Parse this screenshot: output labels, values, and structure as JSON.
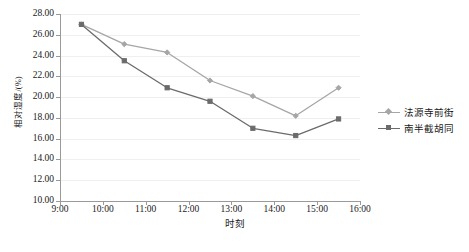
{
  "chart_data": {
    "type": "line",
    "title": "",
    "xlabel": "时刻",
    "ylabel": "相对湿度/(%)",
    "xlim": [
      "9:00",
      "16:00"
    ],
    "ylim": [
      10.0,
      28.0
    ],
    "ytick_step": 2.0,
    "grid": true,
    "legend_position": "right",
    "x_ticks": [
      "9:00",
      "10:00",
      "11:00",
      "12:00",
      "13:00",
      "14:00",
      "15:00",
      "16:00"
    ],
    "y_ticks": [
      "10.00",
      "12.00",
      "14.00",
      "16.00",
      "18.00",
      "20.00",
      "22.00",
      "24.00",
      "26.00",
      "28.00"
    ],
    "x": [
      "9:30",
      "10:30",
      "11:30",
      "12:30",
      "13:30",
      "14:30",
      "15:30"
    ],
    "series": [
      {
        "name": "法源寺前街",
        "color": "#a6a6a6",
        "marker": "diamond",
        "values": [
          27.0,
          25.1,
          24.3,
          21.6,
          20.1,
          18.2,
          20.9
        ]
      },
      {
        "name": "南半截胡同",
        "color": "#6b6b6b",
        "marker": "square",
        "values": [
          27.0,
          23.5,
          20.9,
          19.6,
          17.0,
          16.3,
          17.9
        ]
      }
    ]
  },
  "axes": {
    "y_title": "相对湿度/(%)",
    "x_title": "时刻"
  },
  "legend": {
    "items": [
      {
        "label": "法源寺前街",
        "color": "#a6a6a6"
      },
      {
        "label": "南半截胡同",
        "color": "#6b6b6b"
      }
    ]
  },
  "colors": {
    "series1": "#a6a6a6",
    "series2": "#6b6b6b",
    "axis": "#9a9a9a",
    "grid": "#efefef",
    "text": "#1a1a1a",
    "background": "#ffffff"
  }
}
